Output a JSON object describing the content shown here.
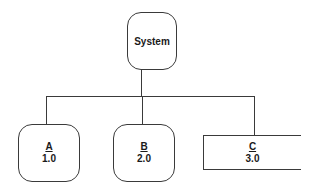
{
  "diagram": {
    "type": "hierarchy",
    "root": {
      "label": "System"
    },
    "children": [
      {
        "id": "A",
        "number": "1.0",
        "shape": "rounded-rectangle"
      },
      {
        "id": "B",
        "number": "2.0",
        "shape": "rounded-rectangle"
      },
      {
        "id": "C",
        "number": "3.0",
        "shape": "open-rectangle"
      }
    ],
    "colors": {
      "stroke": "#3a3a3a",
      "background": "#ffffff"
    }
  }
}
